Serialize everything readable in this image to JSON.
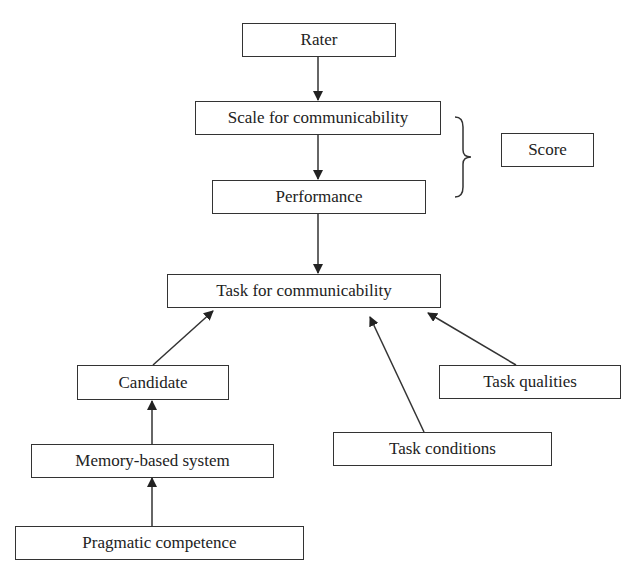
{
  "diagram": {
    "nodes": {
      "rater": "Rater",
      "scale": "Scale for communicability",
      "performance": "Performance",
      "score": "Score",
      "task": "Task for communicability",
      "candidate": "Candidate",
      "task_qualities": "Task qualities",
      "task_conditions": "Task conditions",
      "memory": "Memory-based system",
      "pragmatic": "Pragmatic competence"
    },
    "edges": [
      {
        "from": "rater",
        "to": "scale"
      },
      {
        "from": "scale",
        "to": "performance"
      },
      {
        "from": "performance",
        "to": "task"
      },
      {
        "from": "candidate",
        "to": "task"
      },
      {
        "from": "task_conditions",
        "to": "task"
      },
      {
        "from": "task_qualities",
        "to": "task"
      },
      {
        "from": "memory",
        "to": "candidate"
      },
      {
        "from": "pragmatic",
        "to": "memory"
      }
    ],
    "brace_groups": [
      {
        "members": [
          "scale",
          "performance"
        ],
        "label_node": "score"
      }
    ]
  }
}
